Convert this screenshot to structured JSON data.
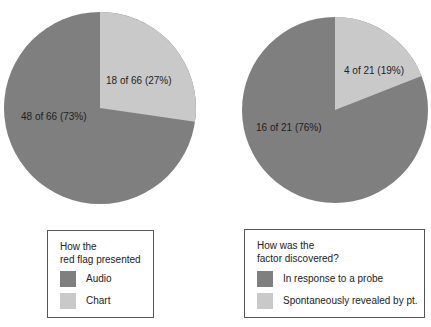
{
  "colors": {
    "dark": "#7f7f7f",
    "light": "#c9c9c9"
  },
  "chart_data": [
    {
      "type": "pie",
      "title": "How the red flag presented",
      "categories": [
        "Audio",
        "Chart"
      ],
      "values": [
        48,
        18
      ],
      "total": 66,
      "percentages": [
        73,
        27
      ],
      "slice_labels": [
        "48 of 66 (73%)",
        "18 of 66 (27%)"
      ],
      "legend": {
        "title_lines": [
          "How the",
          "red flag presented"
        ],
        "entries": [
          "Audio",
          "Chart"
        ]
      }
    },
    {
      "type": "pie",
      "title": "How was the factor discovered?",
      "categories": [
        "In response to a probe",
        "Spontaneously revealed by pt."
      ],
      "values": [
        16,
        4
      ],
      "total": 21,
      "percentages": [
        76,
        19
      ],
      "slice_labels": [
        "16 of 21 (76%)",
        "4 of 21 (19%)"
      ],
      "legend": {
        "title_lines": [
          "How was the",
          "factor discovered?"
        ],
        "entries": [
          "In response to a probe",
          "Spontaneously revealed by pt."
        ]
      }
    }
  ]
}
